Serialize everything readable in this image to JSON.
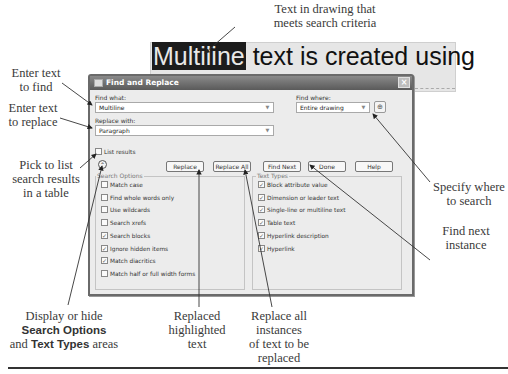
{
  "drawing": {
    "highlighted_word": "Multiline",
    "rest_text": " text is created using"
  },
  "dialog": {
    "title": "Find and Replace",
    "close_glyph": "×",
    "find_what": {
      "label": "Find what:",
      "value": "Multiline"
    },
    "find_where": {
      "label": "Find where:",
      "value": "Entire drawing",
      "pick_glyph": "⊕"
    },
    "replace_with": {
      "label": "Replace with:",
      "value": "Paragraph"
    },
    "list_results": {
      "label": "List results",
      "checked": false
    },
    "toggle_glyph": "⌃",
    "buttons": {
      "replace": "Replace",
      "replace_all": "Replace All",
      "find_next": "Find Next",
      "done": "Done",
      "help": "Help"
    },
    "search_options": {
      "title": "Search Options",
      "items": [
        {
          "label": "Match case",
          "checked": false
        },
        {
          "label": "Find whole words only",
          "checked": false
        },
        {
          "label": "Use wildcards",
          "checked": false
        },
        {
          "label": "Search xrefs",
          "checked": false
        },
        {
          "label": "Search blocks",
          "checked": true
        },
        {
          "label": "Ignore hidden items",
          "checked": true
        },
        {
          "label": "Match diacritics",
          "checked": true
        },
        {
          "label": "Match half or full width forms",
          "checked": false
        }
      ]
    },
    "text_types": {
      "title": "Text Types",
      "items": [
        {
          "label": "Block attribute value",
          "checked": true
        },
        {
          "label": "Dimension or leader text",
          "checked": true
        },
        {
          "label": "Single-line or multiline text",
          "checked": true
        },
        {
          "label": "Table text",
          "checked": true
        },
        {
          "label": "Hyperlink description",
          "checked": true
        },
        {
          "label": "Hyperlink",
          "checked": true
        }
      ]
    }
  },
  "callouts": {
    "text_in_drawing": [
      "Text in drawing that",
      "meets search criteria"
    ],
    "enter_find": [
      "Enter text",
      "to find"
    ],
    "enter_replace": [
      "Enter text",
      "to replace"
    ],
    "list_results": [
      "Pick to list",
      "search results",
      "in a table"
    ],
    "specify_where": [
      "Specify where",
      "to search"
    ],
    "find_next": [
      "Find next",
      "instance"
    ],
    "display_hide": {
      "line1": "Display or hide",
      "bold1": "Search Options",
      "and": "and ",
      "bold2": "Text Types",
      "tail": " areas"
    },
    "replaced": [
      "Replaced",
      "highlighted",
      "text"
    ],
    "replace_all": [
      "Replace all",
      "instances",
      "of text to be",
      "replaced"
    ]
  },
  "check_glyph": "✓"
}
